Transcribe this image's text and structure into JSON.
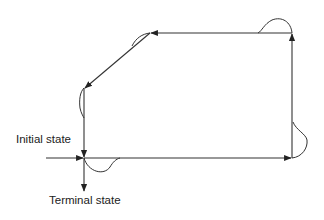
{
  "diagram": {
    "type": "state-trajectory",
    "labels": {
      "initial": "Initial state",
      "terminal": "Terminal state"
    },
    "colors": {
      "line": "#333333",
      "text": "#222222",
      "background": "#ffffff"
    },
    "nodes": [
      {
        "id": "start",
        "x": 84,
        "y": 158
      },
      {
        "id": "bottom-right",
        "x": 292,
        "y": 158
      },
      {
        "id": "top-right",
        "x": 292,
        "y": 33
      },
      {
        "id": "top-left",
        "x": 150,
        "y": 33
      },
      {
        "id": "left-mid",
        "x": 84,
        "y": 88
      }
    ],
    "edges": [
      {
        "from": "start",
        "to": "bottom-right",
        "direction": "right"
      },
      {
        "from": "bottom-right",
        "to": "top-right",
        "direction": "up"
      },
      {
        "from": "top-right",
        "to": "top-left",
        "direction": "left"
      },
      {
        "from": "top-left",
        "to": "left-mid",
        "direction": "down-left"
      },
      {
        "from": "left-mid",
        "to": "start",
        "direction": "down"
      }
    ],
    "entry_arrow": "Initial state (from left)",
    "exit_arrow": "Terminal state (downward)"
  }
}
